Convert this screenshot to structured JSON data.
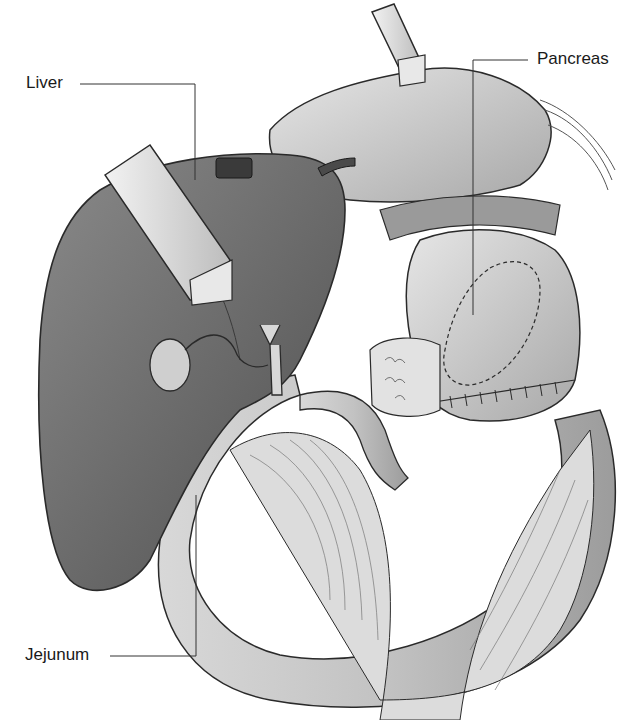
{
  "figure": {
    "labels": {
      "liver": "Liver",
      "pancreas": "Pancreas",
      "jejunum": "Jejunum"
    },
    "colors": {
      "liver": "#6f6f6f",
      "liver_dark": "#4f4f4f",
      "organ_light": "#cfcfcf",
      "organ_mid": "#b4b4b4",
      "retractor": "#d9d9d9",
      "line": "#2a2a2a",
      "background": "#ffffff"
    }
  }
}
